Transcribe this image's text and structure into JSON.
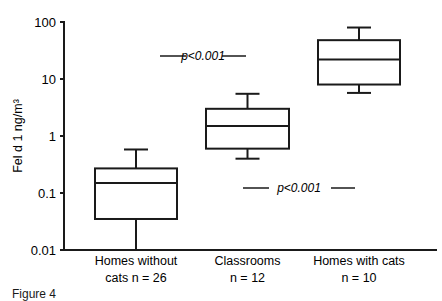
{
  "chart_data": {
    "type": "box",
    "title": "",
    "xlabel": "",
    "ylabel": "Fel d 1 ng/m³",
    "yscale": "log",
    "ylim": [
      0.01,
      100
    ],
    "yticks": [
      "0.01",
      "0.1",
      "1",
      "10",
      "100"
    ],
    "grid": false,
    "categories": [
      {
        "line1": "Homes without",
        "line2": "cats n = 26"
      },
      {
        "line1": "Classrooms",
        "line2": "n = 12"
      },
      {
        "line1": "Homes with cats",
        "line2": "n = 10"
      }
    ],
    "boxes": [
      {
        "name": "Homes without cats",
        "n": 26,
        "whisker_low": 0.01,
        "q1": 0.035,
        "median": 0.15,
        "q3": 0.27,
        "whisker_high": 0.58
      },
      {
        "name": "Classrooms",
        "n": 12,
        "whisker_low": 0.4,
        "q1": 0.6,
        "median": 1.5,
        "q3": 3.0,
        "whisker_high": 5.5
      },
      {
        "name": "Homes with cats",
        "n": 10,
        "whisker_low": 5.7,
        "q1": 8.0,
        "median": 22,
        "q3": 48,
        "whisker_high": 80
      }
    ],
    "annotations": [
      {
        "text": "p<0.001",
        "between": [
          "Homes without cats",
          "Classrooms"
        ],
        "y": 25
      },
      {
        "text": "p<0.001",
        "between": [
          "Classrooms",
          "Homes with cats"
        ],
        "y": 0.12
      }
    ]
  },
  "caption": "Figure 4"
}
